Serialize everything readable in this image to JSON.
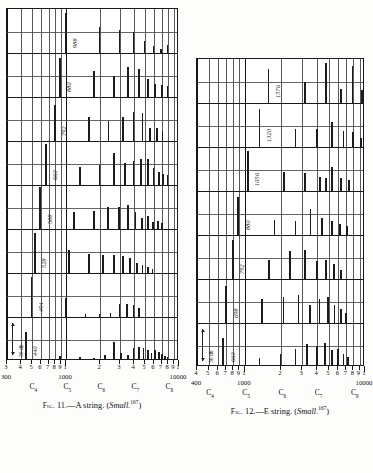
{
  "figures": [
    {
      "id": "fig-11",
      "caption_prefix": "Fig.",
      "caption_number": "11.",
      "caption_dash": "—",
      "caption_title": "A string.",
      "caption_source_open": "(",
      "caption_source": "Small.",
      "caption_ref": "167",
      "caption_close": ")",
      "db_label": "30 db",
      "axis": {
        "start": 300,
        "end": 10000,
        "decade_labels": [
          "300",
          "1000",
          "10000"
        ],
        "tick_labels": [
          "3",
          "4",
          "5",
          "6",
          "7",
          "8",
          "9",
          "1",
          "2",
          "3",
          "4",
          "5",
          "6",
          "7",
          "8",
          "9",
          "1"
        ],
        "tick_values": [
          300,
          400,
          500,
          600,
          700,
          800,
          900,
          1000,
          2000,
          3000,
          4000,
          5000,
          6000,
          7000,
          8000,
          9000,
          10000
        ]
      },
      "octave_marks": [
        {
          "label": "C",
          "sub": "4",
          "freq": 523
        },
        {
          "label": "C",
          "sub": "5",
          "freq": 1046
        },
        {
          "label": "C",
          "sub": "6",
          "freq": 2093
        },
        {
          "label": "C",
          "sub": "7",
          "freq": 4186
        },
        {
          "label": "C",
          "sub": "8",
          "freq": 8372
        }
      ],
      "panels": [
        {
          "fundamental": 988,
          "label": "988",
          "spikes": [
            [
              988,
              96
            ],
            [
              1976,
              62
            ],
            [
              2964,
              55
            ],
            [
              3952,
              50
            ],
            [
              4940,
              28
            ],
            [
              5928,
              16
            ],
            [
              6916,
              9
            ],
            [
              7904,
              18
            ]
          ]
        },
        {
          "fundamental": 880,
          "label": "880",
          "spikes": [
            [
              880,
              92
            ],
            [
              1760,
              62
            ],
            [
              2640,
              50
            ],
            [
              3520,
              72
            ],
            [
              4400,
              66
            ],
            [
              5280,
              44
            ],
            [
              6160,
              30
            ],
            [
              7040,
              28
            ],
            [
              7920,
              26
            ]
          ]
        },
        {
          "fundamental": 792,
          "label": "792",
          "spikes": [
            [
              792,
              86
            ],
            [
              1584,
              58
            ],
            [
              2376,
              48
            ],
            [
              3168,
              58
            ],
            [
              3960,
              68
            ],
            [
              4752,
              66
            ],
            [
              5544,
              30
            ],
            [
              6336,
              32
            ],
            [
              7128,
              24
            ]
          ]
        },
        {
          "fundamental": 660,
          "label": "660",
          "spikes": [
            [
              660,
              98
            ],
            [
              1320,
              44
            ],
            [
              1980,
              48
            ],
            [
              2640,
              76
            ],
            [
              3300,
              52
            ],
            [
              3960,
              56
            ],
            [
              4620,
              62
            ],
            [
              5280,
              62
            ],
            [
              5940,
              40
            ],
            [
              6600,
              30
            ],
            [
              7260,
              26
            ],
            [
              7920,
              24
            ]
          ]
        },
        {
          "fundamental": 588,
          "label": "588",
          "spikes": [
            [
              588,
              100
            ],
            [
              1176,
              40
            ],
            [
              1764,
              42
            ],
            [
              2352,
              52
            ],
            [
              2940,
              52
            ],
            [
              3528,
              56
            ],
            [
              4116,
              40
            ],
            [
              4704,
              26
            ],
            [
              5292,
              30
            ],
            [
              5880,
              16
            ],
            [
              6468,
              20
            ],
            [
              7056,
              14
            ]
          ]
        },
        {
          "fundamental": 528,
          "label": "528",
          "spikes": [
            [
              528,
              96
            ],
            [
              1056,
              54
            ],
            [
              1584,
              46
            ],
            [
              2112,
              44
            ],
            [
              2640,
              42
            ],
            [
              3168,
              40
            ],
            [
              3696,
              36
            ],
            [
              4224,
              24
            ],
            [
              4752,
              20
            ],
            [
              5280,
              14
            ],
            [
              5808,
              10
            ]
          ]
        },
        {
          "fundamental": 494,
          "label": "494",
          "spikes": [
            [
              494,
              96
            ],
            [
              988,
              46
            ],
            [
              1482,
              8
            ],
            [
              1976,
              7
            ],
            [
              2470,
              9
            ],
            [
              2964,
              32
            ],
            [
              3458,
              30
            ],
            [
              3952,
              28
            ],
            [
              4446,
              22
            ]
          ]
        },
        {
          "fundamental": 440,
          "label": "440",
          "spikes": [
            [
              440,
              70
            ],
            [
              880,
              12
            ],
            [
              1320,
              10
            ],
            [
              1760,
              8
            ],
            [
              2200,
              14
            ],
            [
              2640,
              46
            ],
            [
              3080,
              18
            ],
            [
              3520,
              14
            ],
            [
              3960,
              30
            ],
            [
              4400,
              34
            ],
            [
              4840,
              32
            ],
            [
              5280,
              26
            ],
            [
              5720,
              20
            ],
            [
              6160,
              26
            ],
            [
              6600,
              22
            ],
            [
              7040,
              16
            ],
            [
              7480,
              12
            ],
            [
              7920,
              10
            ]
          ]
        }
      ]
    },
    {
      "id": "fig-12",
      "caption_prefix": "Fig.",
      "caption_number": "12.",
      "caption_dash": "—",
      "caption_title": "E string.",
      "caption_source_open": "(",
      "caption_source": "Small.",
      "caption_ref": "167",
      "caption_close": ")",
      "db_label": "30 db",
      "axis": {
        "start": 400,
        "end": 10000,
        "decade_labels": [
          "400",
          "1000",
          "10000"
        ],
        "tick_labels": [
          "4",
          "5",
          "6",
          "7",
          "8",
          "9",
          "1",
          "2",
          "3",
          "4",
          "5",
          "6",
          "7",
          "8",
          "9",
          "1"
        ],
        "tick_values": [
          400,
          500,
          600,
          700,
          800,
          900,
          1000,
          2000,
          3000,
          4000,
          5000,
          6000,
          7000,
          8000,
          9000,
          10000
        ]
      },
      "octave_marks": [
        {
          "label": "C",
          "sub": "4",
          "freq": 523
        },
        {
          "label": "C",
          "sub": "5",
          "freq": 1046
        },
        {
          "label": "C",
          "sub": "6",
          "freq": 2093
        },
        {
          "label": "C",
          "sub": "7",
          "freq": 4186
        },
        {
          "label": "C",
          "sub": "8",
          "freq": 8372
        }
      ],
      "panels": [
        {
          "fundamental": 1576,
          "label": "1576",
          "spikes": [
            [
              1576,
              82
            ],
            [
              3152,
              50
            ],
            [
              4728,
              96
            ],
            [
              6304,
              34
            ],
            [
              7880,
              88
            ],
            [
              9456,
              30
            ]
          ]
        },
        {
          "fundamental": 1320,
          "label": "1320",
          "spikes": [
            [
              1320,
              90
            ],
            [
              2640,
              42
            ],
            [
              3960,
              44
            ],
            [
              5280,
              60
            ],
            [
              6600,
              38
            ],
            [
              7920,
              36
            ],
            [
              9240,
              22
            ]
          ]
        },
        {
          "fundamental": 1056,
          "label": "1056",
          "spikes": [
            [
              1056,
              96
            ],
            [
              2112,
              46
            ],
            [
              3168,
              44
            ],
            [
              4224,
              34
            ],
            [
              4752,
              30
            ],
            [
              5280,
              58
            ],
            [
              6336,
              30
            ],
            [
              7392,
              26
            ]
          ]
        },
        {
          "fundamental": 880,
          "label": "880",
          "spikes": [
            [
              880,
              90
            ],
            [
              1760,
              36
            ],
            [
              2640,
              34
            ],
            [
              3520,
              62
            ],
            [
              4400,
              40
            ],
            [
              5280,
              34
            ],
            [
              6160,
              26
            ],
            [
              7040,
              22
            ]
          ]
        },
        {
          "fundamental": 792,
          "label": "792",
          "spikes": [
            [
              792,
              92
            ],
            [
              1584,
              46
            ],
            [
              2376,
              66
            ],
            [
              3168,
              68
            ],
            [
              3960,
              44
            ],
            [
              4752,
              46
            ],
            [
              5544,
              36
            ],
            [
              6336,
              22
            ]
          ]
        },
        {
          "fundamental": 698,
          "label": "698",
          "spikes": [
            [
              698,
              88
            ],
            [
              1396,
              58
            ],
            [
              2094,
              62
            ],
            [
              2792,
              66
            ],
            [
              3490,
              44
            ],
            [
              4188,
              56
            ],
            [
              4886,
              62
            ],
            [
              5584,
              44
            ],
            [
              6282,
              34
            ],
            [
              6980,
              24
            ]
          ]
        },
        {
          "fundamental": 660,
          "label": "660",
          "spikes": [
            [
              660,
              70
            ],
            [
              1320,
              22
            ],
            [
              1980,
              30
            ],
            [
              2640,
              42
            ],
            [
              3300,
              54
            ],
            [
              3960,
              50
            ],
            [
              4620,
              58
            ],
            [
              5280,
              40
            ],
            [
              5940,
              44
            ],
            [
              6600,
              30
            ],
            [
              7260,
              24
            ]
          ]
        }
      ]
    }
  ]
}
